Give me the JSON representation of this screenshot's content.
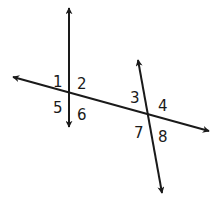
{
  "diagram": {
    "colors": {
      "line": "#1a1a1a",
      "background": "#ffffff"
    },
    "lines": [
      {
        "id": "line-a",
        "x1": 69,
        "y1": 8,
        "x2": 69,
        "y2": 127
      },
      {
        "id": "line-b",
        "x1": 138,
        "y1": 60,
        "x2": 162,
        "y2": 193
      },
      {
        "id": "transversal",
        "x1": 13,
        "y1": 77,
        "x2": 209,
        "y2": 131
      }
    ],
    "angle_labels": [
      {
        "text": "1",
        "x": 53,
        "y": 87
      },
      {
        "text": "2",
        "x": 77,
        "y": 89
      },
      {
        "text": "3",
        "x": 130,
        "y": 103
      },
      {
        "text": "4",
        "x": 158,
        "y": 111
      },
      {
        "text": "5",
        "x": 53,
        "y": 113
      },
      {
        "text": "6",
        "x": 77,
        "y": 120
      },
      {
        "text": "7",
        "x": 134,
        "y": 138
      },
      {
        "text": "8",
        "x": 158,
        "y": 142
      }
    ]
  }
}
